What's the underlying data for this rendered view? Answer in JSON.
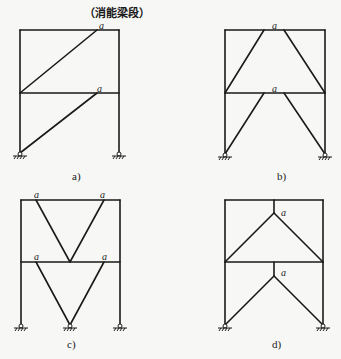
{
  "title": "（消能梁段）",
  "link_symbol": "a",
  "colors": {
    "line": "#1a1a1a",
    "background": "#f7f7f5"
  },
  "panels": [
    {
      "id": "a",
      "caption": "a)",
      "description": "Single diagonal eccentric braces per storey, link at upper right of each beam"
    },
    {
      "id": "b",
      "caption": "b)",
      "description": "Chevron (inverted-V) braces with central link segment at each beam"
    },
    {
      "id": "c",
      "caption": "c)",
      "description": "V-braces with link segments at both ends of each beam; middle support"
    },
    {
      "id": "d",
      "caption": "d)",
      "description": "Y-shaped eccentric braces with vertical link below each beam"
    }
  ]
}
